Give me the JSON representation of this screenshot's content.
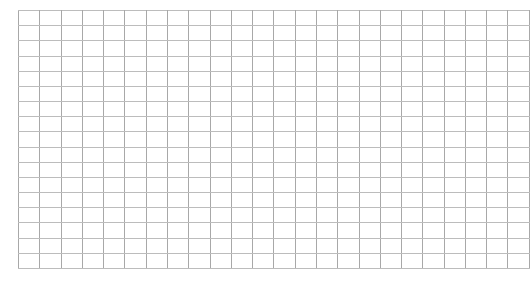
{
  "canvas": {
    "width": 523,
    "height": 281,
    "background_color": "#ffffff"
  },
  "grid": {
    "name": "empty-grid",
    "description": "Blank graph-paper style rectangular grid of empty cells",
    "left": 18,
    "top": 10,
    "width": 487,
    "height": 258,
    "columns": 24,
    "rows": 17,
    "cell_width": 20.3,
    "cell_height": 15.2,
    "line_width": 1,
    "vertical_line_color": "#a8a8a8",
    "horizontal_line_color": "#bcbcbc",
    "cell_fill_color": "#ffffff",
    "has_labels": false,
    "has_axes": false,
    "cell_text": ""
  },
  "chart_data": {
    "type": "table",
    "title": "",
    "subtitle": "",
    "xlabel": "",
    "ylabel": "",
    "columns": 24,
    "rows": 17,
    "column_headers": [],
    "row_headers": [],
    "values": [],
    "grid": true,
    "legend": null,
    "annotations": []
  }
}
